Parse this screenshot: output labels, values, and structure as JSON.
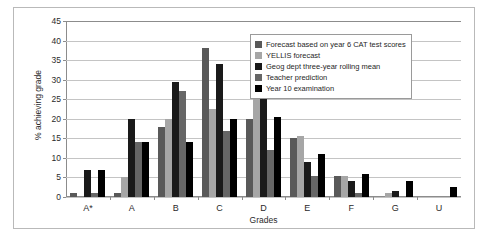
{
  "chart_data": {
    "type": "bar",
    "title": "",
    "xlabel": "Grades",
    "ylabel": "% achieving grade",
    "ylim": [
      0,
      45
    ],
    "yticks": [
      0,
      5,
      10,
      15,
      20,
      25,
      30,
      35,
      40,
      45
    ],
    "grid": true,
    "legend_position": "top-right",
    "categories": [
      "A*",
      "A",
      "B",
      "C",
      "D",
      "E",
      "F",
      "G",
      "U"
    ],
    "series": [
      {
        "name": "Forecast based on year 6 CAT test scores",
        "color": "#595959",
        "values": [
          1,
          1,
          18,
          38,
          20,
          15,
          5.5,
          0,
          0
        ]
      },
      {
        "name": "YELLIS forecast",
        "color": "#a6a6a6",
        "values": [
          0,
          5,
          20,
          22.5,
          25,
          15.5,
          5.5,
          1,
          0
        ]
      },
      {
        "name": "Geog dept three-year rolling mean",
        "color": "#1a1a1a",
        "values": [
          7,
          20,
          29.5,
          34,
          27.5,
          9,
          4,
          1.5,
          0
        ]
      },
      {
        "name": "Teacher prediction",
        "color": "#666666",
        "values": [
          1,
          14,
          27,
          17,
          12,
          5.5,
          1,
          0,
          0
        ]
      },
      {
        "name": "Year 10 examination",
        "color": "#000000",
        "values": [
          7,
          14,
          14,
          20,
          20.5,
          11,
          6,
          4,
          2.5
        ]
      }
    ]
  },
  "caption": ""
}
